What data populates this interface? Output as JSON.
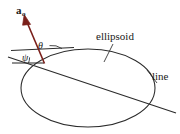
{
  "figure": {
    "width": 180,
    "height": 134,
    "background": "#ffffff",
    "stroke_color": "#2b2b2b",
    "vector_color": "#7a1f1a"
  },
  "labels": {
    "ellipsoid": "ellipsoid",
    "line": "line",
    "theta": "θ",
    "psi": "ψ",
    "vector_base": "a",
    "vector_subscript": "o"
  },
  "geometry": {
    "ellipse": {
      "cx": 88,
      "cy": 88,
      "rx": 67,
      "ry": 39
    },
    "secant_line": {
      "x1": 8,
      "y1": 57,
      "x2": 176,
      "y2": 113
    },
    "tangent_line": {
      "x1": 11,
      "y1": 50,
      "x2": 73,
      "y2": 48
    },
    "vector_arrow": {
      "tail_x": 44,
      "tail_y": 63,
      "tip_x": 24,
      "tip_y": 14
    },
    "ellipsoid_leader": {
      "x1": 112,
      "y1": 45,
      "x2": 104,
      "y2": 62
    },
    "line_leader": {
      "x1": 158,
      "y1": 84,
      "x2": 146,
      "y2": 70
    },
    "angle_theta_arc_radius": 18,
    "angle_psi_arc_radius": 16
  }
}
